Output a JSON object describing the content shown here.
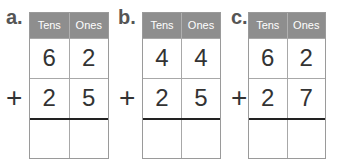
{
  "headers": {
    "tens": "Tens",
    "ones": "Ones"
  },
  "operator": "+",
  "problems": [
    {
      "label": "a.",
      "top": [
        "6",
        "2"
      ],
      "bottom": [
        "2",
        "5"
      ],
      "answer": [
        "",
        ""
      ]
    },
    {
      "label": "b.",
      "top": [
        "4",
        "4"
      ],
      "bottom": [
        "2",
        "5"
      ],
      "answer": [
        "",
        ""
      ]
    },
    {
      "label": "c.",
      "top": [
        "6",
        "2"
      ],
      "bottom": [
        "2",
        "7"
      ],
      "answer": [
        "",
        ""
      ]
    }
  ],
  "colors": {
    "header_bg": "#8e8e8e",
    "header_text": "#ffffff",
    "sum_line": "#222222"
  }
}
